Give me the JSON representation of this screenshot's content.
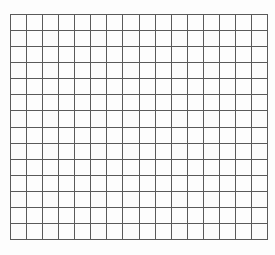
{
  "grid": {
    "columns": 16,
    "rows": 14,
    "line_color": "#5a5a5a",
    "background": "#fdfdfd"
  }
}
